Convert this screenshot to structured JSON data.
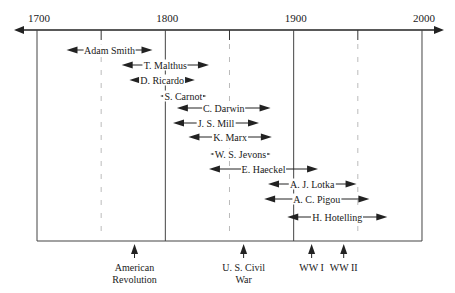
{
  "axis": {
    "years": [
      {
        "label": "1700",
        "year": 1700
      },
      {
        "label": "1800",
        "year": 1800
      },
      {
        "label": "1900",
        "year": 1900
      },
      {
        "label": "2000",
        "year": 2000
      }
    ],
    "dashed_years": [
      1750,
      1850,
      1950
    ]
  },
  "people": [
    {
      "name": "Adam Smith",
      "start": 1723,
      "end": 1790
    },
    {
      "name": "T. Malthus",
      "start": 1766,
      "end": 1834
    },
    {
      "name": "D. Ricardo",
      "start": 1772,
      "end": 1823
    },
    {
      "name": "S. Carnot",
      "start": 1796,
      "end": 1832
    },
    {
      "name": "C. Darwin",
      "start": 1809,
      "end": 1882
    },
    {
      "name": "J. S. Mill",
      "start": 1806,
      "end": 1873
    },
    {
      "name": "K. Marx",
      "start": 1818,
      "end": 1883
    },
    {
      "name": "W. S. Jevons",
      "start": 1835,
      "end": 1882
    },
    {
      "name": "E. Haeckel",
      "start": 1834,
      "end": 1919
    },
    {
      "name": "A. J. Lotka",
      "start": 1880,
      "end": 1949
    },
    {
      "name": "A. C. Pigou",
      "start": 1877,
      "end": 1959
    },
    {
      "name": "H. Hotelling",
      "start": 1895,
      "end": 1973
    }
  ],
  "events": [
    {
      "label": "American Revolution",
      "line1": "American",
      "line2": "Revolution",
      "year": 1776
    },
    {
      "label": "U. S. Civil War",
      "line1": "U. S. Civil",
      "line2": "War",
      "year": 1861
    },
    {
      "label": "WW I",
      "line1": "WW I",
      "line2": "",
      "year": 1914
    },
    {
      "label": "WW II",
      "line1": "WW II",
      "line2": "",
      "year": 1939
    }
  ]
}
